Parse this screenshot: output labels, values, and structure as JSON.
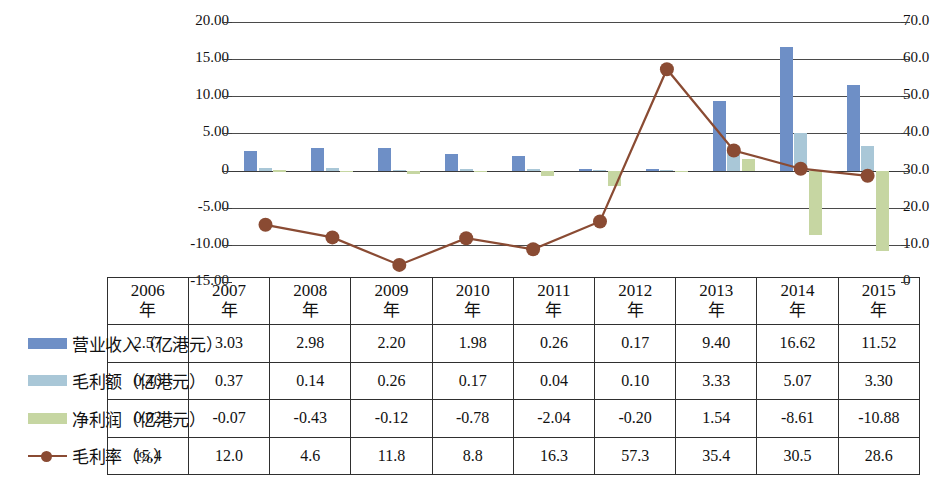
{
  "chart_data": {
    "type": "bar",
    "title": "",
    "subtitle": "",
    "xlabel": "",
    "ylabel": "",
    "grid": true,
    "legend_position": "table-left",
    "categories": [
      "2006年",
      "2007年",
      "2008年",
      "2009年",
      "2010年",
      "2011年",
      "2012年",
      "2013年",
      "2014年",
      "2015年"
    ],
    "left_axis": {
      "label": "亿港元",
      "ticks": [
        "20.00",
        "15.00",
        "10.00",
        "5.00",
        "0",
        "-5.00",
        "-10.00",
        "-15.00"
      ],
      "tick_values": [
        20,
        15,
        10,
        5,
        0,
        -5,
        -10,
        -15
      ],
      "ylim": [
        -15,
        20
      ]
    },
    "right_axis": {
      "label": "%",
      "ticks": [
        "70.0",
        "60.0",
        "50.0",
        "40.0",
        "30.0",
        "20.0",
        "10.0",
        "0"
      ],
      "tick_values": [
        70,
        60,
        50,
        40,
        30,
        20,
        10,
        0
      ],
      "ylim": [
        0,
        70
      ]
    },
    "series": [
      {
        "name": "营业收入（亿港元）",
        "kind": "bar",
        "axis": "left",
        "color": "#6e8fc6",
        "values": [
          2.57,
          3.03,
          2.98,
          2.2,
          1.98,
          0.26,
          0.17,
          9.4,
          16.62,
          11.52
        ]
      },
      {
        "name": "毛利额（亿港元）",
        "kind": "bar",
        "axis": "left",
        "color": "#a9c7d7",
        "values": [
          0.4,
          0.37,
          0.14,
          0.26,
          0.17,
          0.04,
          0.1,
          3.33,
          5.07,
          3.3
        ]
      },
      {
        "name": "净利润（亿港元）",
        "kind": "bar",
        "axis": "left",
        "color": "#c6d6a2",
        "values": [
          0.02,
          -0.07,
          -0.43,
          -0.12,
          -0.78,
          -2.04,
          -0.2,
          1.54,
          -8.61,
          -10.88
        ]
      },
      {
        "name": "毛利率（%）",
        "kind": "line",
        "axis": "right",
        "color": "#8a4b33",
        "values": [
          15.4,
          12.0,
          4.6,
          11.8,
          8.8,
          16.3,
          57.3,
          35.4,
          30.5,
          28.6
        ]
      }
    ]
  },
  "table": {
    "header": [
      "2006年",
      "2007年",
      "2008年",
      "2009年",
      "2010年",
      "2011年",
      "2012年",
      "2013年",
      "2014年",
      "2015年"
    ],
    "header_lines": [
      [
        "2006",
        "年"
      ],
      [
        "2007",
        "年"
      ],
      [
        "2008",
        "年"
      ],
      [
        "2009",
        "年"
      ],
      [
        "2010",
        "年"
      ],
      [
        "2011",
        "年"
      ],
      [
        "2012",
        "年"
      ],
      [
        "2013",
        "年"
      ],
      [
        "2014",
        "年"
      ],
      [
        "2015",
        "年"
      ]
    ],
    "rows": [
      {
        "label": "营业收入（亿港元）",
        "swatch": "bar-blue",
        "cells": [
          "2.57",
          "3.03",
          "2.98",
          "2.20",
          "1.98",
          "0.26",
          "0.17",
          "9.40",
          "16.62",
          "11.52"
        ]
      },
      {
        "label": "毛利额（亿港元）",
        "swatch": "bar-lightblue",
        "cells": [
          "0.40",
          "0.37",
          "0.14",
          "0.26",
          "0.17",
          "0.04",
          "0.10",
          "3.33",
          "5.07",
          "3.30"
        ]
      },
      {
        "label": "净利润（亿港元）",
        "swatch": "bar-green",
        "cells": [
          "0.02",
          "-0.07",
          "-0.43",
          "-0.12",
          "-0.78",
          "-2.04",
          "-0.20",
          "1.54",
          "-8.61",
          "-10.88"
        ]
      },
      {
        "label": "毛利率（%）",
        "swatch": "line-marker",
        "cells": [
          "15.4",
          "12.0",
          "4.6",
          "11.8",
          "8.8",
          "16.3",
          "57.3",
          "35.4",
          "30.5",
          "28.6"
        ]
      }
    ]
  },
  "colors": {
    "revenue": "#6e8fc6",
    "gross_profit": "#a9c7d7",
    "net_profit": "#c6d6a2",
    "margin_line": "#8a4b33",
    "grid": "#4a4a4a",
    "text": "#111111",
    "background": "#ffffff"
  }
}
